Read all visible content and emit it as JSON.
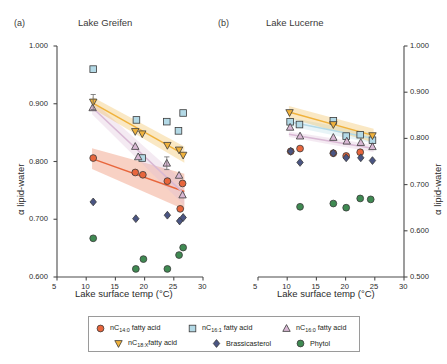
{
  "panels": [
    {
      "id": "a",
      "label": "(a)",
      "title": "Lake Greifen"
    },
    {
      "id": "b",
      "label": "(b)",
      "title": "Lake Lucerne"
    }
  ],
  "axes": {
    "x_label": "Lake surface temp (°C)",
    "x_ticks": [
      "5",
      "10",
      "15",
      "20",
      "25",
      "30"
    ],
    "y_label_left": "α lipid-water",
    "y_label_right": "α lipid-water",
    "y_ticks_left": [
      "0.600",
      "0.700",
      "0.800",
      "0.900",
      "1.000"
    ],
    "y_ticks_right": [
      "0.500",
      "0.600",
      "0.700",
      "0.800",
      "0.900",
      "1.000"
    ]
  },
  "legend": {
    "rows": [
      [
        {
          "name": "nc14-fatty-acid",
          "marker": "circle",
          "color": "#e8663c",
          "text_pre": "nC",
          "text_sub": "14:0",
          "text_post": " fatty acid"
        },
        {
          "name": "nc16-1-fatty-acid",
          "marker": "square",
          "color": "#b3d9e6",
          "text_pre": "nC",
          "text_sub": "16:1",
          "text_post": " fatty acid"
        },
        {
          "name": "nc16-0-fatty-acid",
          "marker": "triangle-up",
          "color": "#d9b8d4",
          "text_pre": "nC",
          "text_sub": "16:0",
          "text_post": " fatty acid"
        }
      ],
      [
        {
          "name": "nc18-x-fatty-acid",
          "marker": "triangle-down",
          "color": "#f0b23c",
          "text_pre": "nC",
          "text_sub": "18:X",
          "text_post": "fatty acid"
        },
        {
          "name": "brassicasterol",
          "marker": "diamond",
          "color": "#4a5583",
          "text_pre": "",
          "text_sub": "",
          "text_post": "Brassicasterol"
        },
        {
          "name": "phytol",
          "marker": "circle",
          "color": "#3f8a52",
          "text_pre": "",
          "text_sub": "",
          "text_post": "Phytol"
        }
      ]
    ]
  },
  "chart_data": {
    "type": "scatter",
    "title": "",
    "xlabel": "Lake surface temp (°C)",
    "ylabel": "α lipid-water",
    "xlim": [
      5,
      30
    ],
    "ylim_left": [
      0.6,
      1.0
    ],
    "ylim_right": [
      0.5,
      1.0
    ],
    "grid": false,
    "legend_position": "bottom",
    "panels": [
      {
        "panel": "a",
        "title": "Lake Greifen",
        "ylim": [
          0.6,
          1.0
        ],
        "series": [
          {
            "name": "nC14:0 fatty acid",
            "color": "#e8663c",
            "marker": "circle",
            "points": [
              {
                "x": 11.2,
                "y": 0.806
              },
              {
                "x": 18.4,
                "y": 0.781
              },
              {
                "x": 19.7,
                "y": 0.777
              },
              {
                "x": 23.9,
                "y": 0.766
              },
              {
                "x": 26.5,
                "y": 0.762
              },
              {
                "x": 26.1,
                "y": 0.718
              }
            ],
            "fit": {
              "x0": 11.0,
              "y0": 0.805,
              "x1": 26.8,
              "y1": 0.748,
              "band_half0": 0.018,
              "band_half1": 0.031
            }
          },
          {
            "name": "nC16:1 fatty acid",
            "color": "#b3d9e6",
            "marker": "square",
            "points": [
              {
                "x": 11.2,
                "y": 0.96
              },
              {
                "x": 18.6,
                "y": 0.872
              },
              {
                "x": 19.6,
                "y": 0.806
              },
              {
                "x": 23.8,
                "y": 0.869
              },
              {
                "x": 25.8,
                "y": 0.853
              },
              {
                "x": 26.6,
                "y": 0.884
              }
            ],
            "fit": null
          },
          {
            "name": "nC16:0 fatty acid",
            "color": "#d9b8d4",
            "marker": "triangle-up",
            "points": [
              {
                "x": 11.1,
                "y": 0.893
              },
              {
                "x": 18.4,
                "y": 0.826
              },
              {
                "x": 18.9,
                "y": 0.808
              },
              {
                "x": 23.8,
                "y": 0.797
              },
              {
                "x": 25.9,
                "y": 0.776
              },
              {
                "x": 26.5,
                "y": 0.742
              }
            ],
            "fit": {
              "x0": 11.0,
              "y0": 0.894,
              "x1": 26.8,
              "y1": 0.744,
              "band_half0": 0.012,
              "band_half1": 0.02
            }
          },
          {
            "name": "nC18:X fatty acid",
            "color": "#f0b23c",
            "marker": "triangle-down",
            "points": [
              {
                "x": 11.2,
                "y": 0.903
              },
              {
                "x": 18.4,
                "y": 0.852
              },
              {
                "x": 19.6,
                "y": 0.848
              },
              {
                "x": 23.9,
                "y": 0.828
              },
              {
                "x": 25.9,
                "y": 0.82
              },
              {
                "x": 26.6,
                "y": 0.811
              }
            ],
            "fit": {
              "x0": 11.0,
              "y0": 0.902,
              "x1": 26.8,
              "y1": 0.812,
              "band_half0": 0.01,
              "band_half1": 0.014
            }
          },
          {
            "name": "Brassicasterol",
            "color": "#4a5583",
            "marker": "diamond",
            "points": [
              {
                "x": 11.2,
                "y": 0.73
              },
              {
                "x": 18.5,
                "y": 0.701
              },
              {
                "x": 23.9,
                "y": 0.707
              },
              {
                "x": 26.0,
                "y": 0.697
              },
              {
                "x": 26.6,
                "y": 0.703
              }
            ],
            "fit": null
          },
          {
            "name": "Phytol",
            "color": "#3f8a52",
            "marker": "circle",
            "points": [
              {
                "x": 11.2,
                "y": 0.667
              },
              {
                "x": 18.5,
                "y": 0.614
              },
              {
                "x": 19.8,
                "y": 0.631
              },
              {
                "x": 23.9,
                "y": 0.614
              },
              {
                "x": 25.9,
                "y": 0.638
              },
              {
                "x": 26.6,
                "y": 0.651
              }
            ],
            "fit": null
          }
        ]
      },
      {
        "panel": "b",
        "title": "Lake Lucerne",
        "ylim": [
          0.5,
          1.0
        ],
        "series": [
          {
            "name": "nC14:0 fatty acid",
            "color": "#e8663c",
            "marker": "circle",
            "points": [
              {
                "x": 10.6,
                "y": 0.772
              },
              {
                "x": 12.2,
                "y": 0.778
              },
              {
                "x": 17.9,
                "y": 0.768
              },
              {
                "x": 20.1,
                "y": 0.762
              },
              {
                "x": 22.5,
                "y": 0.77
              }
            ],
            "fit": null
          },
          {
            "name": "nC16:1 fatty acid",
            "color": "#b3d9e6",
            "marker": "square",
            "points": [
              {
                "x": 10.5,
                "y": 0.836
              },
              {
                "x": 12.1,
                "y": 0.83
              },
              {
                "x": 17.9,
                "y": 0.838
              },
              {
                "x": 20.1,
                "y": 0.805
              },
              {
                "x": 22.5,
                "y": 0.808
              },
              {
                "x": 24.6,
                "y": 0.796
              }
            ],
            "fit": {
              "x0": 10.3,
              "y0": 0.836,
              "x1": 24.8,
              "y1": 0.8,
              "band_half0": 0.009,
              "band_half1": 0.011
            }
          },
          {
            "name": "nC16:0 fatty acid",
            "color": "#d9b8d4",
            "marker": "triangle-up",
            "points": [
              {
                "x": 10.5,
                "y": 0.824
              },
              {
                "x": 12.2,
                "y": 0.805
              },
              {
                "x": 17.9,
                "y": 0.802
              },
              {
                "x": 20.2,
                "y": 0.794
              },
              {
                "x": 22.6,
                "y": 0.791
              },
              {
                "x": 24.6,
                "y": 0.782
              }
            ],
            "fit": {
              "x0": 10.3,
              "y0": 0.809,
              "x1": 24.8,
              "y1": 0.778,
              "band_half0": 0.006,
              "band_half1": 0.008
            }
          },
          {
            "name": "nC18:X fatty acid",
            "color": "#f0b23c",
            "marker": "triangle-down",
            "points": [
              {
                "x": 10.4,
                "y": 0.856
              },
              {
                "x": 17.9,
                "y": 0.83
              },
              {
                "x": 24.6,
                "y": 0.806
              }
            ],
            "fit": {
              "x0": 10.3,
              "y0": 0.857,
              "x1": 24.8,
              "y1": 0.806,
              "band_half0": 0.013,
              "band_half1": 0.015
            }
          },
          {
            "name": "Brassicasterol",
            "color": "#4a5583",
            "marker": "diamond",
            "points": [
              {
                "x": 10.6,
                "y": 0.772
              },
              {
                "x": 12.2,
                "y": 0.748
              },
              {
                "x": 17.9,
                "y": 0.768
              },
              {
                "x": 20.1,
                "y": 0.758
              },
              {
                "x": 22.6,
                "y": 0.758
              },
              {
                "x": 24.6,
                "y": 0.752
              }
            ],
            "fit": null
          },
          {
            "name": "Phytol",
            "color": "#3f8a52",
            "marker": "circle",
            "points": [
              {
                "x": 12.2,
                "y": 0.652
              },
              {
                "x": 17.9,
                "y": 0.659
              },
              {
                "x": 20.1,
                "y": 0.65
              },
              {
                "x": 22.5,
                "y": 0.67
              },
              {
                "x": 24.3,
                "y": 0.668
              }
            ],
            "fit": null
          }
        ]
      }
    ]
  }
}
